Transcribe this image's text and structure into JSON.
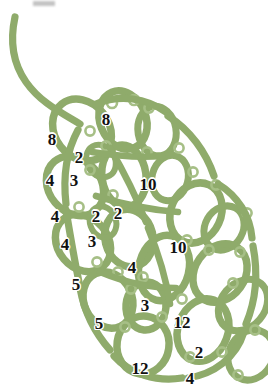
{
  "document": {
    "title": "Tatting Lace Motif Pattern Diagram",
    "type": "pattern-diagram",
    "subject": "leaf-shaped tatted lace motif with stitch counts",
    "background_color": "#ffffff"
  },
  "style": {
    "thread_color": "#8fab6b",
    "picot_color": "#a6bf86",
    "label_color": "#111111",
    "label_halo_color": "#ffffff"
  },
  "diagram": {
    "tail": {
      "name": "thread-tail",
      "description": "curved working thread leading into the motif from upper-left"
    },
    "rings": [
      {
        "id": "r1",
        "cx": 82,
        "cy": 130,
        "rx": 27,
        "ry": 33,
        "rot": -38,
        "sw": 7.5
      },
      {
        "id": "r2",
        "cx": 123,
        "cy": 120,
        "rx": 23,
        "ry": 30,
        "rot": -22,
        "sw": 7.5
      },
      {
        "id": "r3",
        "cx": 157,
        "cy": 131,
        "rx": 19,
        "ry": 25,
        "rot": -10,
        "sw": 7.0
      },
      {
        "id": "r4",
        "cx": 75,
        "cy": 186,
        "rx": 26,
        "ry": 32,
        "rot": -40,
        "sw": 7.5
      },
      {
        "id": "r5",
        "cx": 124,
        "cy": 176,
        "rx": 22,
        "ry": 31,
        "rot": -8,
        "sw": 7.5
      },
      {
        "id": "r6",
        "cx": 170,
        "cy": 178,
        "rx": 18,
        "ry": 23,
        "rot": 15,
        "sw": 7.0
      },
      {
        "id": "r7",
        "cx": 196,
        "cy": 213,
        "rx": 25,
        "ry": 31,
        "rot": 25,
        "sw": 7.5
      },
      {
        "id": "r8",
        "cx": 83,
        "cy": 243,
        "rx": 25,
        "ry": 31,
        "rot": -40,
        "sw": 7.5
      },
      {
        "id": "r9",
        "cx": 129,
        "cy": 238,
        "rx": 24,
        "ry": 29,
        "rot": -14,
        "sw": 7.5
      },
      {
        "id": "r10",
        "cx": 224,
        "cy": 228,
        "rx": 19,
        "ry": 23,
        "rot": 30,
        "sw": 7.0
      },
      {
        "id": "r11",
        "cx": 164,
        "cy": 268,
        "rx": 25,
        "ry": 33,
        "rot": 14,
        "sw": 7.5
      },
      {
        "id": "r12",
        "cx": 220,
        "cy": 273,
        "rx": 25,
        "ry": 31,
        "rot": 35,
        "sw": 7.5
      },
      {
        "id": "r13",
        "cx": 108,
        "cy": 300,
        "rx": 24,
        "ry": 29,
        "rot": -25,
        "sw": 7.5
      },
      {
        "id": "r14",
        "cx": 146,
        "cy": 306,
        "rx": 20,
        "ry": 24,
        "rot": 5,
        "sw": 7.5
      },
      {
        "id": "r15",
        "cx": 143,
        "cy": 345,
        "rx": 26,
        "ry": 29,
        "rot": 8,
        "sw": 7.5
      },
      {
        "id": "r16",
        "cx": 203,
        "cy": 330,
        "rx": 25,
        "ry": 32,
        "rot": 20,
        "sw": 7.5
      },
      {
        "id": "r17",
        "cx": 243,
        "cy": 305,
        "rx": 22,
        "ry": 28,
        "rot": 40,
        "sw": 7.0
      },
      {
        "id": "r18",
        "cx": 251,
        "cy": 355,
        "rx": 22,
        "ry": 26,
        "rot": 30,
        "sw": 7.0
      },
      {
        "id": "r19",
        "cx": 101,
        "cy": 161,
        "rx": 14,
        "ry": 17,
        "rot": -30,
        "sw": 6.0
      },
      {
        "id": "r20",
        "cx": 103,
        "cy": 222,
        "rx": 13,
        "ry": 16,
        "rot": -20,
        "sw": 6.0
      }
    ],
    "picots": [
      {
        "cx": 112,
        "cy": 103,
        "r": 5.0
      },
      {
        "cx": 134,
        "cy": 100,
        "r": 5.0
      },
      {
        "cx": 149,
        "cy": 108,
        "r": 4.6
      },
      {
        "cx": 147,
        "cy": 152,
        "r": 4.6
      },
      {
        "cx": 106,
        "cy": 146,
        "r": 4.6
      },
      {
        "cx": 90,
        "cy": 170,
        "r": 4.6
      },
      {
        "cx": 113,
        "cy": 195,
        "r": 4.6
      },
      {
        "cx": 179,
        "cy": 148,
        "r": 4.6
      },
      {
        "cx": 193,
        "cy": 172,
        "r": 4.6
      },
      {
        "cx": 216,
        "cy": 185,
        "r": 4.6
      },
      {
        "cx": 209,
        "cy": 250,
        "r": 4.6
      },
      {
        "cx": 187,
        "cy": 240,
        "r": 4.6
      },
      {
        "cx": 240,
        "cy": 252,
        "r": 4.6
      },
      {
        "cx": 247,
        "cy": 213,
        "r": 4.6
      },
      {
        "cx": 97,
        "cy": 262,
        "r": 4.6
      },
      {
        "cx": 118,
        "cy": 272,
        "r": 4.6
      },
      {
        "cx": 143,
        "cy": 277,
        "r": 4.6
      },
      {
        "cx": 131,
        "cy": 289,
        "r": 4.6
      },
      {
        "cx": 125,
        "cy": 327,
        "r": 4.6
      },
      {
        "cx": 162,
        "cy": 317,
        "r": 4.6
      },
      {
        "cx": 182,
        "cy": 299,
        "r": 4.6
      },
      {
        "cx": 233,
        "cy": 283,
        "r": 4.6
      },
      {
        "cx": 222,
        "cy": 352,
        "r": 4.6
      },
      {
        "cx": 190,
        "cy": 357,
        "r": 4.6
      },
      {
        "cx": 255,
        "cy": 330,
        "r": 4.6
      },
      {
        "cx": 238,
        "cy": 375,
        "r": 4.6
      },
      {
        "cx": 79,
        "cy": 207,
        "r": 4.6
      },
      {
        "cx": 90,
        "cy": 131,
        "r": 4.6
      }
    ],
    "stitch_counts": [
      {
        "name": "count-8-upper-inner",
        "value": "8",
        "x": 106,
        "y": 119
      },
      {
        "name": "count-8-upper-left",
        "value": "8",
        "x": 52,
        "y": 139
      },
      {
        "name": "count-2-upper-left",
        "value": "2",
        "x": 79,
        "y": 157
      },
      {
        "name": "count-4-upper-left",
        "value": "4",
        "x": 50,
        "y": 180
      },
      {
        "name": "count-3-upper-left",
        "value": "3",
        "x": 74,
        "y": 180
      },
      {
        "name": "count-10-upper-right",
        "value": "10",
        "x": 148,
        "y": 184
      },
      {
        "name": "count-4-mid-left",
        "value": "4",
        "x": 55,
        "y": 216
      },
      {
        "name": "count-2-mid-a",
        "value": "2",
        "x": 96,
        "y": 216
      },
      {
        "name": "count-2-mid-b",
        "value": "2",
        "x": 118,
        "y": 213
      },
      {
        "name": "count-4-mid-left-2",
        "value": "4",
        "x": 65,
        "y": 244
      },
      {
        "name": "count-3-mid",
        "value": "3",
        "x": 92,
        "y": 241
      },
      {
        "name": "count-10-mid-right",
        "value": "10",
        "x": 178,
        "y": 247
      },
      {
        "name": "count-5-lower-left",
        "value": "5",
        "x": 76,
        "y": 284
      },
      {
        "name": "count-4-lower-mid",
        "value": "4",
        "x": 132,
        "y": 267
      },
      {
        "name": "count-5-lower-left-2",
        "value": "5",
        "x": 99,
        "y": 323
      },
      {
        "name": "count-3-lower-ring",
        "value": "3",
        "x": 145,
        "y": 305
      },
      {
        "name": "count-12-lower-right",
        "value": "12",
        "x": 182,
        "y": 322
      },
      {
        "name": "count-2-bottom-right",
        "value": "2",
        "x": 199,
        "y": 352
      },
      {
        "name": "count-12-bottom",
        "value": "12",
        "x": 140,
        "y": 368
      },
      {
        "name": "count-4-bottom-right",
        "value": "4",
        "x": 190,
        "y": 378
      }
    ]
  }
}
